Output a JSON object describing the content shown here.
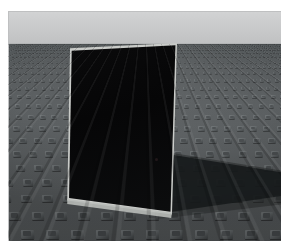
{
  "page": {
    "watermark_text": "",
    "background_color": "#ffffff",
    "width": 281,
    "height": 241
  },
  "scene": {
    "name": "3d-render-viewport",
    "description": "Synthetic 3D render: a tall dark rectangular panel standing upright on a studded gray floor plane under a flat light-gray sky, casting a hard shadow to the right.",
    "caption": "",
    "viewport": {
      "left": 8,
      "top": 11,
      "width": 273,
      "height": 230
    },
    "sky": {
      "label": "",
      "color_top": "#d2d3d4",
      "color_bottom": "#c0c1c2",
      "horizon_y": 33
    },
    "floor": {
      "label": "",
      "base_color": "#5c6062",
      "stud_highlight_color": "#7d8284",
      "stud_shadow_color": "#3f4345",
      "pattern": "studded grid in perspective"
    },
    "panel": {
      "label": "",
      "fill_color": "#08090a",
      "edge_color": "#c9cbc8",
      "top_left": [
        65,
        40
      ],
      "top_right": [
        168,
        34
      ],
      "bottom_right": [
        163,
        203
      ],
      "bottom_left": [
        60,
        187
      ]
    },
    "shadow": {
      "label": "",
      "color": "#16191a",
      "opacity": 0.86
    }
  }
}
